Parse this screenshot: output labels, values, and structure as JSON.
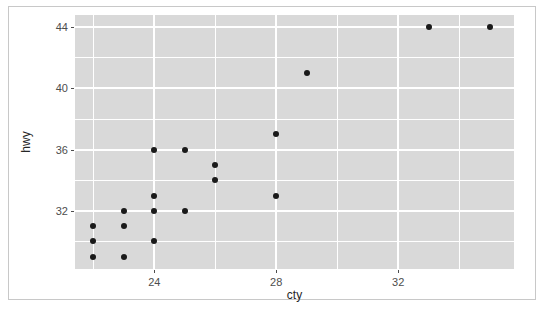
{
  "chart_data": {
    "type": "scatter",
    "title": "",
    "xlabel": "cty",
    "ylabel": "hwy",
    "xlim": [
      21.4,
      35.8
    ],
    "ylim": [
      28.2,
      44.8
    ],
    "xticks": [
      24,
      28,
      32
    ],
    "xticks_minor": [
      22,
      26,
      30,
      34
    ],
    "yticks": [
      44,
      40,
      36,
      32
    ],
    "yticks_minor": [
      42,
      38,
      34,
      30
    ],
    "grid": true,
    "legend": "none",
    "point_color": "#1a1a1a",
    "panel_color": "#d9d9d9",
    "gridline_color": "#ffffff",
    "points": [
      {
        "cty": 22,
        "hwy": 31
      },
      {
        "cty": 22,
        "hwy": 30
      },
      {
        "cty": 22,
        "hwy": 29
      },
      {
        "cty": 23,
        "hwy": 32
      },
      {
        "cty": 23,
        "hwy": 31
      },
      {
        "cty": 23,
        "hwy": 29
      },
      {
        "cty": 24,
        "hwy": 36
      },
      {
        "cty": 24,
        "hwy": 33
      },
      {
        "cty": 24,
        "hwy": 32
      },
      {
        "cty": 24,
        "hwy": 30
      },
      {
        "cty": 25,
        "hwy": 36
      },
      {
        "cty": 25,
        "hwy": 32
      },
      {
        "cty": 26,
        "hwy": 35
      },
      {
        "cty": 26,
        "hwy": 34
      },
      {
        "cty": 28,
        "hwy": 37
      },
      {
        "cty": 28,
        "hwy": 33
      },
      {
        "cty": 29,
        "hwy": 41
      },
      {
        "cty": 33,
        "hwy": 44
      },
      {
        "cty": 35,
        "hwy": 44
      }
    ]
  },
  "axis": {
    "x_title": "cty",
    "y_title": "hwy",
    "x_tick_labels": [
      "24",
      "28",
      "32"
    ],
    "y_tick_labels": [
      "44",
      "40",
      "36",
      "32"
    ]
  },
  "footer": {
    "cut_off_text": ""
  }
}
